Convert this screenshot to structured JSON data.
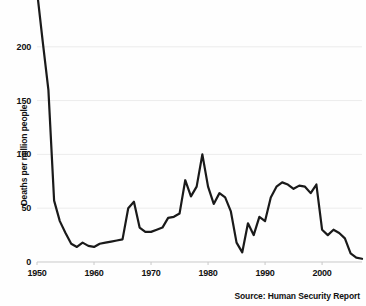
{
  "source": {
    "text": "Source: Human Security Report"
  },
  "chart_data": {
    "type": "line",
    "title": "",
    "subtitle": "",
    "xlabel": "",
    "ylabel": "Deaths per million people",
    "xlim": [
      1950,
      2007
    ],
    "ylim": [
      0,
      250
    ],
    "yticks": [
      0,
      50,
      100,
      150,
      200
    ],
    "ytick_labels": [
      "0",
      "50",
      "100",
      "150",
      "200"
    ],
    "xticks": [
      1950,
      1960,
      1970,
      1980,
      1990,
      2000
    ],
    "xtick_labels": [
      "1950",
      "1960",
      "1970",
      "1980",
      "1990",
      "2000"
    ],
    "grid": "horizontal",
    "legend": "none",
    "line_color": "#1a1a1a",
    "grid_color": "#ececec",
    "background_color": "#fefefe",
    "note": "Line is clipped at the top of the plot area; the 1950 value exceeds the visible 250 maximum.",
    "series": [
      {
        "name": "Deaths per million people",
        "x": [
          1950,
          1951,
          1952,
          1953,
          1954,
          1955,
          1956,
          1957,
          1958,
          1959,
          1960,
          1961,
          1962,
          1963,
          1964,
          1965,
          1966,
          1967,
          1968,
          1969,
          1970,
          1971,
          1972,
          1973,
          1974,
          1975,
          1976,
          1977,
          1978,
          1979,
          1980,
          1981,
          1982,
          1983,
          1984,
          1985,
          1986,
          1987,
          1988,
          1989,
          1990,
          1991,
          1992,
          1993,
          1994,
          1995,
          1996,
          1997,
          1998,
          1999,
          2000,
          2001,
          2002,
          2003,
          2004,
          2005,
          2006,
          2007
        ],
        "values": [
          252,
          205,
          160,
          57,
          38,
          27,
          17,
          14,
          18,
          15,
          14,
          17,
          18,
          19,
          20,
          21,
          50,
          56,
          32,
          28,
          28,
          30,
          32,
          41,
          42,
          45,
          76,
          61,
          70,
          100,
          70,
          54,
          64,
          60,
          47,
          18,
          9,
          36,
          25,
          42,
          38,
          60,
          70,
          74,
          72,
          68,
          71,
          70,
          64,
          72,
          30,
          25,
          30,
          27,
          22,
          8,
          4,
          3
        ],
        "points": [
          {
            "year": 1950,
            "value": 252
          },
          {
            "year": 1951,
            "value": 205
          },
          {
            "year": 1952,
            "value": 160
          },
          {
            "year": 1953,
            "value": 57
          },
          {
            "year": 1954,
            "value": 38
          },
          {
            "year": 1955,
            "value": 27
          },
          {
            "year": 1956,
            "value": 17
          },
          {
            "year": 1957,
            "value": 14
          },
          {
            "year": 1958,
            "value": 18
          },
          {
            "year": 1959,
            "value": 15
          },
          {
            "year": 1960,
            "value": 14
          },
          {
            "year": 1961,
            "value": 17
          },
          {
            "year": 1962,
            "value": 18
          },
          {
            "year": 1963,
            "value": 19
          },
          {
            "year": 1964,
            "value": 20
          },
          {
            "year": 1965,
            "value": 21
          },
          {
            "year": 1966,
            "value": 50
          },
          {
            "year": 1967,
            "value": 56
          },
          {
            "year": 1968,
            "value": 32
          },
          {
            "year": 1969,
            "value": 28
          },
          {
            "year": 1970,
            "value": 28
          },
          {
            "year": 1971,
            "value": 30
          },
          {
            "year": 1972,
            "value": 32
          },
          {
            "year": 1973,
            "value": 41
          },
          {
            "year": 1974,
            "value": 42
          },
          {
            "year": 1975,
            "value": 45
          },
          {
            "year": 1976,
            "value": 76
          },
          {
            "year": 1977,
            "value": 61
          },
          {
            "year": 1978,
            "value": 70
          },
          {
            "year": 1979,
            "value": 100
          },
          {
            "year": 1980,
            "value": 70
          },
          {
            "year": 1981,
            "value": 54
          },
          {
            "year": 1982,
            "value": 64
          },
          {
            "year": 1983,
            "value": 60
          },
          {
            "year": 1984,
            "value": 47
          },
          {
            "year": 1985,
            "value": 18
          },
          {
            "year": 1986,
            "value": 9
          },
          {
            "year": 1987,
            "value": 36
          },
          {
            "year": 1988,
            "value": 25
          },
          {
            "year": 1989,
            "value": 42
          },
          {
            "year": 1990,
            "value": 38
          },
          {
            "year": 1991,
            "value": 60
          },
          {
            "year": 1992,
            "value": 70
          },
          {
            "year": 1993,
            "value": 74
          },
          {
            "year": 1994,
            "value": 72
          },
          {
            "year": 1995,
            "value": 68
          },
          {
            "year": 1996,
            "value": 71
          },
          {
            "year": 1997,
            "value": 70
          },
          {
            "year": 1998,
            "value": 64
          },
          {
            "year": 1999,
            "value": 72
          },
          {
            "year": 2000,
            "value": 30
          },
          {
            "year": 2001,
            "value": 25
          },
          {
            "year": 2002,
            "value": 30
          },
          {
            "year": 2003,
            "value": 27
          },
          {
            "year": 2004,
            "value": 22
          },
          {
            "year": 2005,
            "value": 8
          },
          {
            "year": 2006,
            "value": 4
          },
          {
            "year": 2007,
            "value": 3
          }
        ]
      }
    ]
  }
}
